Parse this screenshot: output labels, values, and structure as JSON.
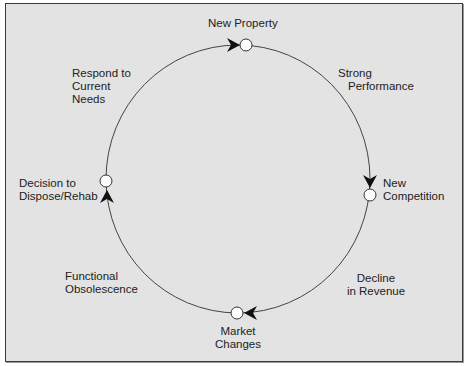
{
  "diagram": {
    "type": "cycle",
    "background_color": "#e3e3e3",
    "line_color": "#333333",
    "nodes": [
      {
        "id": "new-property",
        "label": "New Property"
      },
      {
        "id": "new-competition",
        "label_line1": "New",
        "label_line2": "Competition"
      },
      {
        "id": "market-changes",
        "label_line1": "Market",
        "label_line2": "Changes"
      },
      {
        "id": "decision",
        "label_line1": "Decision to",
        "label_line2": "Dispose/Rehab"
      }
    ],
    "edges": [
      {
        "from": "new-property",
        "to": "new-competition",
        "label_line1": "Strong",
        "label_line2": "Performance"
      },
      {
        "from": "new-competition",
        "to": "market-changes",
        "label_line1": "Decline",
        "label_line2": "in Revenue"
      },
      {
        "from": "market-changes",
        "to": "decision",
        "label_line1": "Functional",
        "label_line2": "Obsolescence"
      },
      {
        "from": "decision",
        "to": "new-property",
        "label_line1": "Respond to",
        "label_line2": "Current",
        "label_line3": "Needs"
      }
    ]
  }
}
